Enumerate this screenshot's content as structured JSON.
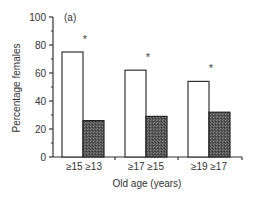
{
  "chart_data": {
    "type": "bar",
    "title": "",
    "panel_label": "(a)",
    "xlabel": "Old age (years)",
    "ylabel": "Percentage females",
    "ylim": [
      0,
      100
    ],
    "yticks": [
      0,
      20,
      40,
      60,
      80,
      100
    ],
    "grid": false,
    "legend": null,
    "groups": [
      {
        "bars": [
          {
            "label": "≥15",
            "value": 75,
            "fill": "white"
          },
          {
            "label": "≥13",
            "value": 26,
            "fill": "dark-stipple"
          }
        ],
        "significance": "*"
      },
      {
        "bars": [
          {
            "label": "≥17",
            "value": 62,
            "fill": "white"
          },
          {
            "label": "≥15",
            "value": 29,
            "fill": "dark-stipple"
          }
        ],
        "significance": "*"
      },
      {
        "bars": [
          {
            "label": "≥19",
            "value": 54,
            "fill": "white"
          },
          {
            "label": "≥17",
            "value": 32,
            "fill": "dark-stipple"
          }
        ],
        "significance": "*"
      }
    ],
    "categories": [
      "≥15 ≥13",
      "≥17 ≥15",
      "≥19 ≥17"
    ],
    "series": [
      {
        "name": "white bars",
        "values": [
          75,
          62,
          54
        ]
      },
      {
        "name": "dark bars",
        "values": [
          26,
          29,
          32
        ]
      }
    ]
  },
  "labels": {
    "panel": "(a)",
    "xlabel": "Old age (years)",
    "ylabel": "Percentage females",
    "yticks": [
      "0",
      "20",
      "40",
      "60",
      "80",
      "100"
    ],
    "groups": [
      "≥15 ≥13",
      "≥17 ≥15",
      "≥19 ≥17"
    ],
    "asterisk": "*"
  }
}
